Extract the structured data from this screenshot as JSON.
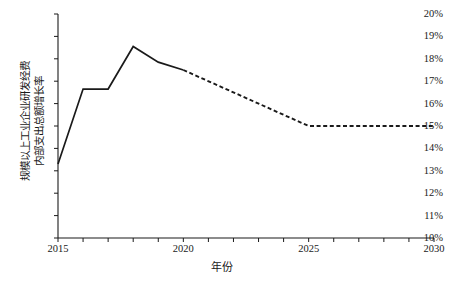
{
  "chart_data": {
    "type": "line",
    "title": "",
    "xlabel": "年份",
    "ylabel_lines": [
      "规模以上工业企业研发经费",
      "内部支出总额增长率"
    ],
    "ylabel": "规模以上工业企业研发经费内部支出总额增长率",
    "xlim": [
      2015,
      2030
    ],
    "ylim": [
      10,
      20
    ],
    "y_tick_step": 1,
    "x_tick_step": 1,
    "x_label_step": 5,
    "grid": false,
    "legend": "none",
    "y_tick_labels": [
      "10%",
      "11%",
      "12%",
      "13%",
      "14%",
      "15%",
      "16%",
      "17%",
      "18%",
      "19%",
      "20%"
    ],
    "y_tick_values": [
      10,
      11,
      12,
      13,
      14,
      15,
      16,
      17,
      18,
      19,
      20
    ],
    "x_tick_values": [
      2015,
      2016,
      2017,
      2018,
      2019,
      2020,
      2021,
      2022,
      2023,
      2024,
      2025,
      2026,
      2027,
      2028,
      2029,
      2030
    ],
    "x_tick_labels": [
      "2015",
      "2020",
      "2025",
      "2030"
    ],
    "x_label_values": [
      2015,
      2020,
      2025,
      2030
    ],
    "line_color": "#1a1a1a",
    "series": [
      {
        "name": "historical",
        "style": "solid",
        "x": [
          2015,
          2016,
          2017,
          2018,
          2019,
          2020
        ],
        "values": [
          13.3,
          16.65,
          16.65,
          18.55,
          17.85,
          17.5
        ]
      },
      {
        "name": "forecast",
        "style": "dashed",
        "x": [
          2020,
          2025,
          2030
        ],
        "values": [
          17.5,
          15.0,
          15.0
        ]
      }
    ]
  }
}
